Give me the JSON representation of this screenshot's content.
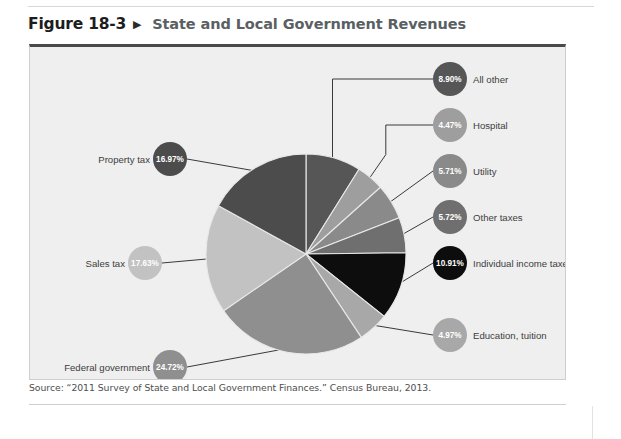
{
  "figure": {
    "number": "Figure 18-3",
    "arrow_icon": "triangle-right-icon",
    "title": "State and Local Government Revenues"
  },
  "source": {
    "text": "Source: “2011 Survey of State and Local Government Finances.” Census Bureau, 2013."
  },
  "body_text_sliver": "",
  "palette": {
    "panel_background": "#efefef",
    "panel_border": "#cfcfcf",
    "panel_top_border": "#4a4a4a",
    "title_color": "#5a5f63",
    "number_color": "#1d1d1d",
    "leader_line": "#3a3a3a",
    "slice_divider": "#e8e8e8"
  },
  "chart_data": {
    "type": "pie",
    "title": "State and Local Government Revenues",
    "subtitle": "",
    "xlabel": "",
    "ylabel": "",
    "units": "percent",
    "legend_position": "callout-labels",
    "grid": false,
    "total": 100.0,
    "start_angle_deg": 0,
    "direction": "clockwise",
    "categories": [
      "All other",
      "Hospital",
      "Utility",
      "Other taxes",
      "Individual income taxes",
      "Education, tuition",
      "Federal government",
      "Sales tax",
      "Property tax"
    ],
    "values": [
      8.9,
      4.47,
      5.71,
      5.72,
      10.91,
      4.97,
      24.72,
      17.63,
      16.97
    ],
    "value_labels": [
      "8.90%",
      "4.47%",
      "5.71%",
      "5.72%",
      "10.91%",
      "4.97%",
      "24.72%",
      "17.63%",
      "16.97%"
    ],
    "colors": [
      "#565656",
      "#9e9e9e",
      "#8a8a8a",
      "#6f6f6f",
      "#0d0d0d",
      "#a8a8a8",
      "#8f8f8f",
      "#c2c2c2",
      "#4c4c4c"
    ],
    "label_text_colors": [
      "#ffffff",
      "#ffffff",
      "#ffffff",
      "#ffffff",
      "#ffffff",
      "#ffffff",
      "#ffffff",
      "#ffffff",
      "#ffffff"
    ],
    "slices": [
      {
        "name": "All other",
        "value": 8.9,
        "label": "8.90%",
        "color": "#565656",
        "side": "right"
      },
      {
        "name": "Hospital",
        "value": 4.47,
        "label": "4.47%",
        "color": "#9e9e9e",
        "side": "right"
      },
      {
        "name": "Utility",
        "value": 5.71,
        "label": "5.71%",
        "color": "#8a8a8a",
        "side": "right"
      },
      {
        "name": "Other taxes",
        "value": 5.72,
        "label": "5.72%",
        "color": "#6f6f6f",
        "side": "right"
      },
      {
        "name": "Individual income taxes",
        "value": 10.91,
        "label": "10.91%",
        "color": "#0d0d0d",
        "side": "right"
      },
      {
        "name": "Education, tuition",
        "value": 4.97,
        "label": "4.97%",
        "color": "#a8a8a8",
        "side": "right"
      },
      {
        "name": "Federal government",
        "value": 24.72,
        "label": "24.72%",
        "color": "#8f8f8f",
        "side": "left"
      },
      {
        "name": "Sales tax",
        "value": 17.63,
        "label": "17.63%",
        "color": "#c2c2c2",
        "side": "left"
      },
      {
        "name": "Property tax",
        "value": 16.97,
        "label": "16.97%",
        "color": "#4c4c4c",
        "side": "left"
      }
    ]
  }
}
